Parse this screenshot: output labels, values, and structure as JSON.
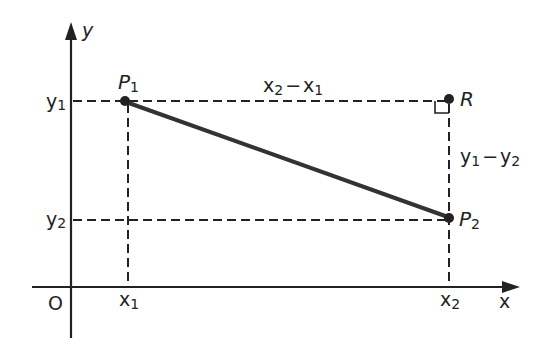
{
  "diagram": {
    "type": "coordinate-distance",
    "colors": {
      "ink": "#222222",
      "background": "#ffffff"
    },
    "axes": {
      "x_label": "x",
      "y_label": "y",
      "origin_label": "O"
    },
    "ticks": {
      "x1": {
        "base": "x",
        "sub": "1"
      },
      "x2": {
        "base": "x",
        "sub": "2"
      },
      "y1": {
        "base": "y",
        "sub": "1"
      },
      "y2": {
        "base": "y",
        "sub": "2"
      }
    },
    "points": {
      "P1": {
        "base": "P",
        "sub": "1"
      },
      "P2": {
        "base": "P",
        "sub": "2"
      },
      "R": {
        "base": "R"
      }
    },
    "annotations": {
      "horizontal_distance": {
        "a": "x",
        "a_sub": "2",
        "op": "−",
        "b": "x",
        "b_sub": "1"
      },
      "vertical_distance": {
        "a": "y",
        "a_sub": "1",
        "op": "−",
        "b": "y",
        "b_sub": "2"
      }
    }
  }
}
